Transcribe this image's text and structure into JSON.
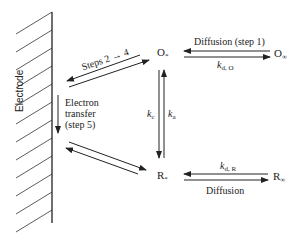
{
  "diagram": {
    "type": "electrode reaction pathway",
    "electrode_label": "Electrode",
    "species": {
      "O_surface": "O",
      "O_surface_sub": "*",
      "O_bulk": "O",
      "O_bulk_sub": "∞",
      "R_surface": "R",
      "R_surface_sub": "*",
      "R_bulk": "R",
      "R_bulk_sub": "∞"
    },
    "labels": {
      "steps_2_4": "Steps 2 → 4",
      "electron_transfer_line1": "Electron",
      "electron_transfer_line2": "transfer",
      "electron_transfer_line3": "(step 5)",
      "diffusion_top": "Diffusion (step 1)",
      "diffusion_bottom": "Diffusion",
      "k_dO": "k",
      "k_dO_sub": "d, O",
      "k_dR": "k",
      "k_dR_sub": "d, R",
      "k_c": "k",
      "k_c_sub": "c",
      "k_a": "k",
      "k_a_sub": "a"
    },
    "colors": {
      "line": "#222222",
      "background": "#ffffff"
    }
  }
}
